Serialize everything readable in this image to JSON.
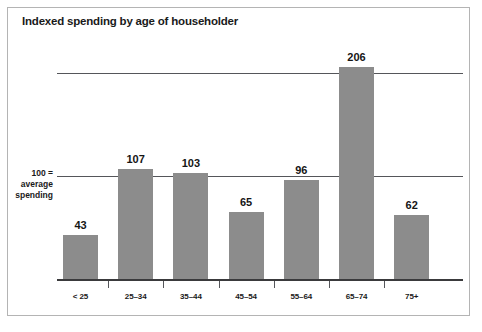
{
  "chart_data": {
    "type": "bar",
    "title": "Indexed spending by age of householder",
    "xlabel": "",
    "ylabel": "",
    "categories": [
      "< 25",
      "25–34",
      "35–44",
      "45–54",
      "55–64",
      "65–74",
      "75+"
    ],
    "values": [
      43,
      107,
      103,
      65,
      96,
      206,
      62
    ],
    "value_labels": [
      "43",
      "107",
      "103",
      "65",
      "96",
      "206",
      "62"
    ],
    "ylim": [
      0,
      215
    ],
    "gridlines": [
      100,
      200
    ],
    "grid": true,
    "legend": null,
    "annotations": {
      "axis_note_line1": "100 =",
      "axis_note_line2": "average",
      "axis_note_line3": "spending"
    },
    "colors": {
      "bar": "#8c8c8c",
      "gridline": "#55565a",
      "axis": "#3a3a3c",
      "text": "#1a1a1a",
      "background": "#ffffff",
      "frame": "#b4b4b4"
    }
  }
}
